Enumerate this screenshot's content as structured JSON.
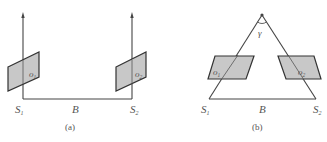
{
  "figure": {
    "panel_a": {
      "caption": "(a)",
      "camera_left": "S",
      "camera_left_sub": "1",
      "camera_right": "S",
      "camera_right_sub": "2",
      "baseline": "B",
      "plane_left": "o",
      "plane_left_sub": "1",
      "plane_right": "o",
      "plane_right_sub": "2"
    },
    "panel_b": {
      "caption": "(b)",
      "camera_left": "S",
      "camera_left_sub": "1",
      "camera_right": "S",
      "camera_right_sub": "2",
      "baseline": "B",
      "angle": "γ",
      "plane_left": "o",
      "plane_left_sub": "1",
      "plane_right": "o",
      "plane_right_sub": "2"
    },
    "colors": {
      "line": "#444444",
      "plane_fill": "#c8c8c8",
      "text": "#555555"
    }
  }
}
